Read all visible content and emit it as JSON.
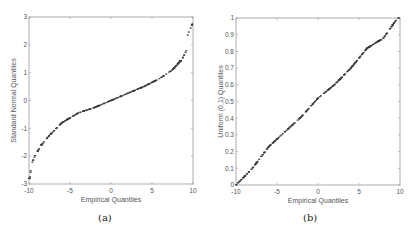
{
  "chart_data": [
    {
      "type": "scatter",
      "title": "",
      "caption": "(a)",
      "xlabel": "Empirical Quantiles",
      "ylabel": "Standard Normal Quantiles",
      "xlim": [
        -10,
        10
      ],
      "ylim": [
        -3,
        3
      ],
      "xticks": [
        -10,
        -5,
        0,
        5,
        10
      ],
      "yticks": [
        -3,
        -2,
        -1,
        0,
        1,
        2,
        3
      ],
      "grid": false,
      "marker": "+",
      "description": "Q-Q plot of uniformly distributed data on [-10,10] against standard normal quantiles; S-shaped curve",
      "points_summary": [
        {
          "x": -9.9,
          "y": -2.8
        },
        {
          "x": -9.7,
          "y": -2.3
        },
        {
          "x": -9.3,
          "y": -2.0
        },
        {
          "x": -8.5,
          "y": -1.6
        },
        {
          "x": -7.5,
          "y": -1.25
        },
        {
          "x": -6.0,
          "y": -0.8
        },
        {
          "x": -4.0,
          "y": -0.45
        },
        {
          "x": -2.0,
          "y": -0.25
        },
        {
          "x": 0.0,
          "y": 0.0
        },
        {
          "x": 2.0,
          "y": 0.25
        },
        {
          "x": 4.0,
          "y": 0.5
        },
        {
          "x": 6.0,
          "y": 0.8
        },
        {
          "x": 7.5,
          "y": 1.1
        },
        {
          "x": 8.7,
          "y": 1.5
        },
        {
          "x": 9.2,
          "y": 1.8
        },
        {
          "x": 9.3,
          "y": 2.2
        },
        {
          "x": 9.4,
          "y": 2.4
        },
        {
          "x": 10.0,
          "y": 2.8
        }
      ]
    },
    {
      "type": "scatter",
      "title": "",
      "caption": "(b)",
      "xlabel": "Empirical Quantiles",
      "ylabel": "Uniform (0,1) Quantiles",
      "xlim": [
        -10,
        10
      ],
      "ylim": [
        0,
        1
      ],
      "xticks": [
        -10,
        -5,
        0,
        5,
        10
      ],
      "yticks": [
        0,
        0.1,
        0.2,
        0.3,
        0.4,
        0.5,
        0.6,
        0.7,
        0.8,
        0.9,
        1
      ],
      "grid": false,
      "marker": "+",
      "description": "Q-Q plot of uniformly distributed data on [-10,10] against uniform (0,1) quantiles; approximately straight line",
      "points_summary": [
        {
          "x": -10,
          "y": 0.0
        },
        {
          "x": -8,
          "y": 0.1
        },
        {
          "x": -6,
          "y": 0.23
        },
        {
          "x": -4,
          "y": 0.32
        },
        {
          "x": -2,
          "y": 0.41
        },
        {
          "x": 0,
          "y": 0.52
        },
        {
          "x": 2,
          "y": 0.6
        },
        {
          "x": 4,
          "y": 0.7
        },
        {
          "x": 6,
          "y": 0.82
        },
        {
          "x": 8,
          "y": 0.88
        },
        {
          "x": 9.7,
          "y": 1.0
        }
      ]
    }
  ],
  "panels": [
    {
      "caption": "(a)",
      "xlabel": "Empirical Quantiles",
      "ylabel": "Standard Normal Quantiles"
    },
    {
      "caption": "(b)",
      "xlabel": "Empirical Quantiles",
      "ylabel": "Uniform (0,1) Quantiles"
    }
  ]
}
